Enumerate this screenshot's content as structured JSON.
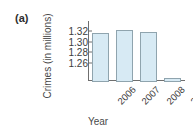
{
  "figure": {
    "part_label": "(a)"
  },
  "chart_data": {
    "type": "bar",
    "title": "",
    "xlabel": "Year",
    "ylabel": "Crimes (in millions)",
    "categories": [
      "2006",
      "2007",
      "2008",
      "2009"
    ],
    "values": [
      1.32,
      1.325,
      1.322,
      1.235
    ],
    "ylim": [
      1.227,
      1.337
    ],
    "yticks": [
      "1.32",
      "1.30",
      "1.28",
      "1.26"
    ],
    "ytick_values": [
      1.32,
      1.3,
      1.28,
      1.26
    ],
    "grid": false,
    "legend": "none",
    "bar_fill_color": "#d7eaf4",
    "bar_edge_color": "#8fa4ae",
    "axis_color": "#6f6f6f"
  }
}
